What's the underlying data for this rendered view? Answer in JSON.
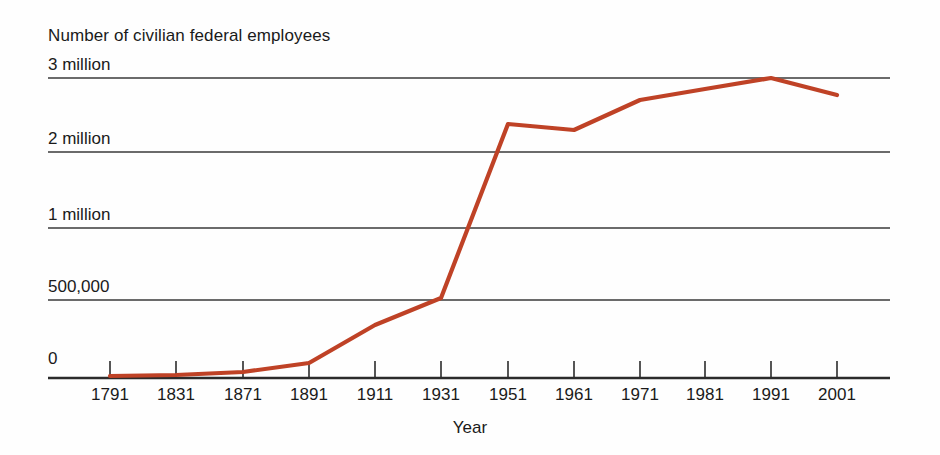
{
  "chart_data": {
    "type": "line",
    "title": "Number of civilian federal employees",
    "xlabel": "Year",
    "ylabel": "",
    "grid": true,
    "legend": false,
    "line_color": "#bf4226",
    "axis_color": "#2b2b2b",
    "grid_color": "#3a3a3a",
    "background": "#fefefe",
    "categories": [
      "1791",
      "1831",
      "1871",
      "1891",
      "1911",
      "1931",
      "1951",
      "1961",
      "1971",
      "1981",
      "1991",
      "2001"
    ],
    "x": [
      1791,
      1831,
      1871,
      1891,
      1911,
      1931,
      1951,
      1961,
      1971,
      1981,
      1991,
      2001
    ],
    "values": [
      5000,
      12000,
      51000,
      157000,
      396000,
      533000,
      2200000,
      2150000,
      2650000,
      2780000,
      3000000,
      2770000
    ],
    "ytick_labels": [
      "3 million",
      "2 million",
      "1 million",
      "500,000",
      "0"
    ],
    "ytick_values": [
      3000000,
      2000000,
      1000000,
      500000,
      0
    ],
    "ylim": [
      0,
      3000000
    ],
    "y_scale_note": "non-linear: equal pixel spacing between 0, 500,000, 1 million, 2 million, 3 million",
    "x_scale_note": "categorical even spacing of year labels"
  },
  "axes": {
    "x_title": "Year",
    "y_ticks": [
      {
        "label": "3 million",
        "y": 78
      },
      {
        "label": "2 million",
        "y": 152
      },
      {
        "label": "1 million",
        "y": 228
      },
      {
        "label": "500,000",
        "y": 300
      },
      {
        "label": "0",
        "y": 372
      }
    ],
    "x_ticks": [
      {
        "label": "1791",
        "x": 110
      },
      {
        "label": "1831",
        "x": 176
      },
      {
        "label": "1871",
        "x": 243
      },
      {
        "label": "1891",
        "x": 309
      },
      {
        "label": "1911",
        "x": 375
      },
      {
        "label": "1931",
        "x": 441
      },
      {
        "label": "1951",
        "x": 508
      },
      {
        "label": "1961",
        "x": 574
      },
      {
        "label": "1971",
        "x": 640
      },
      {
        "label": "1981",
        "x": 705
      },
      {
        "label": "1991",
        "x": 771
      },
      {
        "label": "2001",
        "x": 837
      }
    ]
  },
  "series_points": [
    {
      "year": "1791",
      "px": 110,
      "py": 376
    },
    {
      "year": "1831",
      "px": 176,
      "py": 375
    },
    {
      "year": "1871",
      "px": 243,
      "py": 372
    },
    {
      "year": "1891",
      "px": 309,
      "py": 363
    },
    {
      "year": "1911",
      "px": 375,
      "py": 325
    },
    {
      "year": "1931",
      "px": 441,
      "py": 298
    },
    {
      "year": "1951",
      "px": 508,
      "py": 124
    },
    {
      "year": "1961",
      "px": 574,
      "py": 130
    },
    {
      "year": "1971",
      "px": 640,
      "py": 100
    },
    {
      "year": "1981",
      "px": 705,
      "py": 89
    },
    {
      "year": "1991",
      "px": 771,
      "py": 78
    },
    {
      "year": "2001",
      "px": 837,
      "py": 95
    }
  ]
}
